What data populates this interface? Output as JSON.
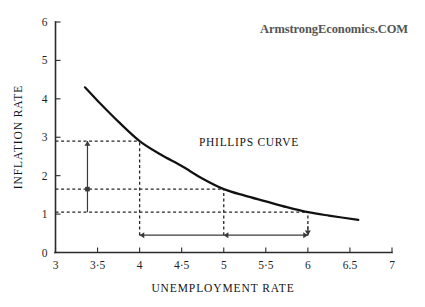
{
  "watermark": {
    "text": "ArmstrongEconomics.COM"
  },
  "chart_data": {
    "type": "line",
    "title": "",
    "xlabel": "UNEMPLOYMENT RATE",
    "ylabel": "INFLATION RATE",
    "xlim": [
      3,
      7
    ],
    "ylim": [
      0,
      6
    ],
    "grid": false,
    "legend": "none",
    "series": [
      {
        "name": "PHILLIPS CURVE",
        "x": [
          3.35,
          3.5,
          3.75,
          4.0,
          4.25,
          4.5,
          4.75,
          5.0,
          5.25,
          5.5,
          5.75,
          6.0,
          6.25,
          6.6
        ],
        "y": [
          4.3,
          3.95,
          3.4,
          2.9,
          2.55,
          2.25,
          1.92,
          1.65,
          1.48,
          1.33,
          1.18,
          1.05,
          0.96,
          0.85
        ]
      }
    ],
    "x_ticks": [
      {
        "value": 3,
        "label": "3"
      },
      {
        "value": 3.5,
        "label": "3·5"
      },
      {
        "value": 4,
        "label": "4"
      },
      {
        "value": 4.5,
        "label": "4·5"
      },
      {
        "value": 5,
        "label": "5"
      },
      {
        "value": 5.5,
        "label": "5·5"
      },
      {
        "value": 6,
        "label": "6"
      },
      {
        "value": 6.5,
        "label": "6.5"
      },
      {
        "value": 7,
        "label": "7"
      }
    ],
    "y_ticks": [
      {
        "value": 0,
        "label": "0"
      },
      {
        "value": 1,
        "label": "1"
      },
      {
        "value": 2,
        "label": "2"
      },
      {
        "value": 3,
        "label": "3"
      },
      {
        "value": 4,
        "label": "4"
      },
      {
        "value": 5,
        "label": "5"
      },
      {
        "value": 6,
        "label": "6"
      }
    ],
    "series_label": "PHILLIPS CURVE",
    "annotations": {
      "guides_horizontal": [
        {
          "y": 2.9,
          "x_from": 3.0,
          "x_to": 4.0
        },
        {
          "y": 1.65,
          "x_from": 3.0,
          "x_to": 5.0
        },
        {
          "y": 1.05,
          "x_from": 3.0,
          "x_to": 6.0
        }
      ],
      "guides_vertical": [
        {
          "x": 4.0,
          "y_from": 0.45,
          "y_to": 2.9
        },
        {
          "x": 5.0,
          "y_from": 0.45,
          "y_to": 1.65
        },
        {
          "x": 6.0,
          "y_from": 0.45,
          "y_to": 1.05
        }
      ],
      "arrow_vertical": {
        "x": 3.38,
        "y_top": 2.9,
        "y_mid": 1.65,
        "y_bottom": 1.05
      },
      "arrow_horizontal": {
        "y": 0.45,
        "x_left": 4.0,
        "x_mid": 5.0,
        "x_right": 6.0
      }
    }
  }
}
